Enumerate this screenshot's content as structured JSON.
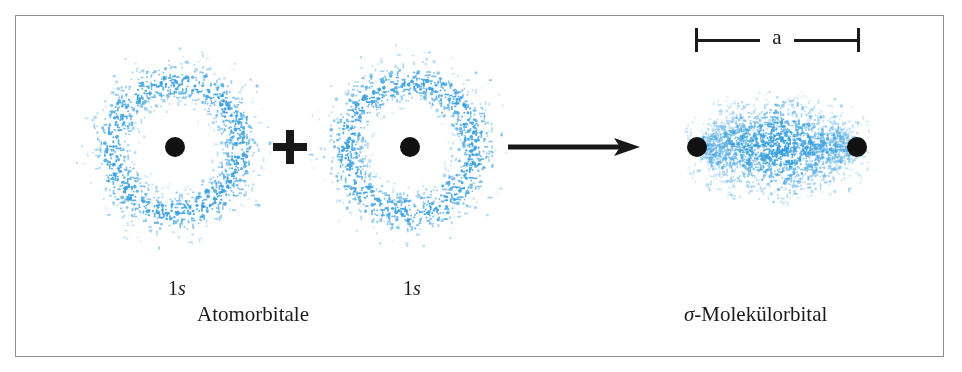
{
  "figure": {
    "background_color": "#ffffff",
    "frame_color": "#8e8e8e",
    "dot_color": "#3aa0e0",
    "nucleus_color": "#111111",
    "ink_color": "#1a1a1a"
  },
  "labels": {
    "orbital_left_n": "1",
    "orbital_left_l": "s",
    "orbital_right_n": "1",
    "orbital_right_l": "s",
    "caption_left": "Atomorbitale",
    "caption_right_symbol": "σ",
    "caption_right_text": "-Molekülorbital"
  },
  "operators": {
    "plus_sign": "+",
    "arrow": "arrow-right"
  },
  "dimension": {
    "label": "a",
    "from_nucleus": "left-nucleus",
    "to_nucleus": "right-nucleus"
  },
  "chart_data": {
    "type": "scatter",
    "xlabel": "",
    "ylabel": "",
    "xlim": [
      0,
      962
    ],
    "ylim": [
      0,
      372
    ],
    "grid": false,
    "legend": "none",
    "annotations": [
      {
        "text": "1s",
        "x": 175,
        "y": 287
      },
      {
        "text": "1s",
        "x": 410,
        "y": 287
      },
      {
        "text": "Atomorbitale",
        "x": 262,
        "y": 313
      },
      {
        "text": "σ-Molekülorbital",
        "x": 777,
        "y": 313
      },
      {
        "text": "a",
        "x": 777,
        "y": 40
      },
      {
        "text": "+",
        "x": 290,
        "y": 147
      },
      {
        "text": "→",
        "x": 574,
        "y": 147
      }
    ],
    "series": [
      {
        "name": "1s atomic orbital (left)",
        "kind": "annulus-dot-cloud",
        "center": [
          175,
          147
        ],
        "mean_radius": 64,
        "radial_sigma": 11,
        "n_points": 1150,
        "color": "#3aa0e0"
      },
      {
        "name": "1s atomic orbital (right)",
        "kind": "annulus-dot-cloud",
        "center": [
          410,
          147
        ],
        "mean_radius": 64,
        "radial_sigma": 11,
        "n_points": 1150,
        "color": "#3aa0e0"
      },
      {
        "name": "sigma molecular orbital",
        "kind": "lens-dot-cloud",
        "center": [
          777,
          147
        ],
        "semi_axis_x": 80,
        "semi_axis_y": 36,
        "n_points": 2000,
        "color": "#3aa0e0"
      },
      {
        "name": "nuclei",
        "kind": "points",
        "color": "#111111",
        "x": [
          175,
          410,
          697,
          857
        ],
        "y": [
          147,
          147,
          147,
          147
        ],
        "radius": 10
      }
    ]
  }
}
